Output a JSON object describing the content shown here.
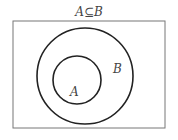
{
  "diagram": {
    "title": "A⊆B",
    "universe": {
      "x": 13,
      "y": 21,
      "width": 152,
      "height": 107
    },
    "sets": [
      {
        "name": "B",
        "label": "B",
        "cx": 85,
        "cy": 76,
        "r": 48,
        "label_x": 113,
        "label_y": 73
      },
      {
        "name": "A",
        "label": "A",
        "cx": 77,
        "cy": 80,
        "r": 24,
        "label_x": 74,
        "label_y": 95
      }
    ],
    "relation": "A is a subset of B"
  }
}
